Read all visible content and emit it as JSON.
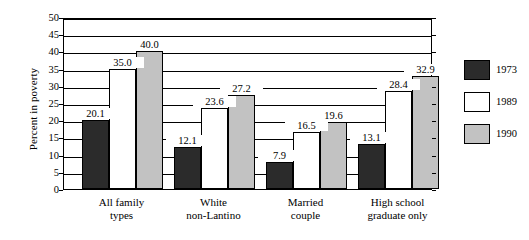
{
  "chart_data": {
    "type": "bar",
    "title": "",
    "xlabel": "",
    "ylabel": "Percent in poverty",
    "ylim": [
      0,
      50
    ],
    "ytick_step": 5,
    "yticks": [
      0,
      5,
      10,
      15,
      20,
      25,
      30,
      35,
      40,
      45,
      50
    ],
    "grid": true,
    "legend_position": "right",
    "categories": [
      {
        "line1": "All family",
        "line2": "types"
      },
      {
        "line1": "White",
        "line2": "non-Lantino"
      },
      {
        "line1": "Married",
        "line2": "couple"
      },
      {
        "line1": "High school",
        "line2": "graduate only"
      }
    ],
    "category_labels": [
      "All family types",
      "White non-Lantino",
      "Married couple",
      "High school graduate only"
    ],
    "series": [
      {
        "name": "1973",
        "color": "#2b2b2b",
        "values": [
          20.1,
          12.1,
          7.9,
          13.1
        ],
        "value_labels": [
          "20.1",
          "12.1",
          "7.9",
          "13.1"
        ]
      },
      {
        "name": "1989",
        "color": "#ffffff",
        "values": [
          35.0,
          23.6,
          16.5,
          28.4
        ],
        "value_labels": [
          "35.0",
          "23.6",
          "16.5",
          "28.4"
        ]
      },
      {
        "name": "1990",
        "color": "#c2c2c2",
        "values": [
          40.0,
          27.2,
          19.6,
          32.9
        ],
        "value_labels": [
          "40.0",
          "27.2",
          "19.6",
          "32.9"
        ]
      }
    ]
  },
  "axis": {
    "y_title": "Percent in poverty",
    "tick_labels": [
      "0",
      "5",
      "10",
      "15",
      "20",
      "25",
      "30",
      "35",
      "40",
      "45",
      "50"
    ]
  },
  "legend": {
    "items": [
      {
        "label": "1973",
        "color": "#2b2b2b"
      },
      {
        "label": "1989",
        "color": "#ffffff"
      },
      {
        "label": "1990",
        "color": "#c2c2c2"
      }
    ]
  }
}
